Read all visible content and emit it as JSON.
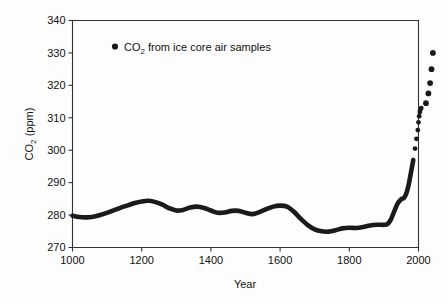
{
  "chart_data": {
    "type": "line",
    "title": "",
    "xlabel": "Year",
    "ylabel": "CO2 (ppm)",
    "ylabel_parts": {
      "pre": "CO",
      "sub": "2",
      "post": " (ppm)"
    },
    "xlim": [
      1000,
      2000
    ],
    "ylim": [
      270,
      340
    ],
    "xticks": [
      1000,
      1200,
      1400,
      1600,
      1800,
      2000
    ],
    "yticks": [
      270,
      280,
      290,
      300,
      310,
      320,
      330,
      340
    ],
    "xtick_labels": [
      "1000",
      "1200",
      "1400",
      "1600",
      "1800",
      "2000"
    ],
    "ytick_labels": [
      "270",
      "280",
      "290",
      "300",
      "310",
      "320",
      "330",
      "340"
    ],
    "grid": false,
    "legend_position": "upper-left-inside",
    "legend": [
      {
        "marker": "filled-circle",
        "label_parts": {
          "pre": "CO",
          "sub": "2",
          "post": " from ice core air samples"
        },
        "label": "CO2 from ice core air samples",
        "color": "#1a1a1a"
      }
    ],
    "series": [
      {
        "name": "CO2 from ice core air samples",
        "color": "#1a1a1a",
        "style": "thick-line-then-discrete-dots",
        "x": [
          1000,
          1020,
          1040,
          1060,
          1080,
          1100,
          1120,
          1140,
          1160,
          1180,
          1200,
          1220,
          1240,
          1260,
          1280,
          1300,
          1320,
          1340,
          1360,
          1380,
          1400,
          1420,
          1440,
          1460,
          1480,
          1500,
          1520,
          1540,
          1560,
          1580,
          1600,
          1620,
          1640,
          1660,
          1680,
          1700,
          1720,
          1740,
          1760,
          1780,
          1800,
          1820,
          1840,
          1860,
          1880,
          1900,
          1910,
          1920,
          1930,
          1940,
          1950,
          1958,
          1965,
          1972,
          1978,
          1985
        ],
        "y": [
          279.8,
          279.4,
          279.3,
          279.5,
          280.0,
          280.7,
          281.5,
          282.3,
          283.0,
          283.7,
          284.2,
          284.4,
          284.0,
          283.2,
          282.1,
          281.4,
          281.6,
          282.3,
          282.6,
          282.2,
          281.4,
          280.7,
          280.8,
          281.3,
          281.3,
          280.7,
          280.3,
          280.9,
          281.8,
          282.6,
          282.9,
          282.6,
          281.0,
          278.8,
          276.9,
          275.6,
          275.0,
          274.9,
          275.3,
          275.9,
          276.1,
          276.0,
          276.3,
          276.8,
          277.0,
          277.0,
          277.2,
          278.6,
          281.2,
          283.6,
          284.9,
          285.3,
          286.7,
          289.6,
          293.0,
          297.0
        ],
        "trailing_points_x": [
          1990,
          1994,
          1998,
          2000,
          2002,
          2004,
          2006,
          2008
        ],
        "trailing_points_y": [
          300.5,
          303.5,
          306.2,
          308.6,
          310.5,
          311.8,
          312.6,
          313.0
        ],
        "separated_dots_x": [
          1958,
          1965,
          1970,
          1974,
          1978
        ],
        "separated_dots_y": [
          314.5,
          317.5,
          320.7,
          325.0,
          330.0
        ]
      }
    ],
    "annotations": []
  }
}
